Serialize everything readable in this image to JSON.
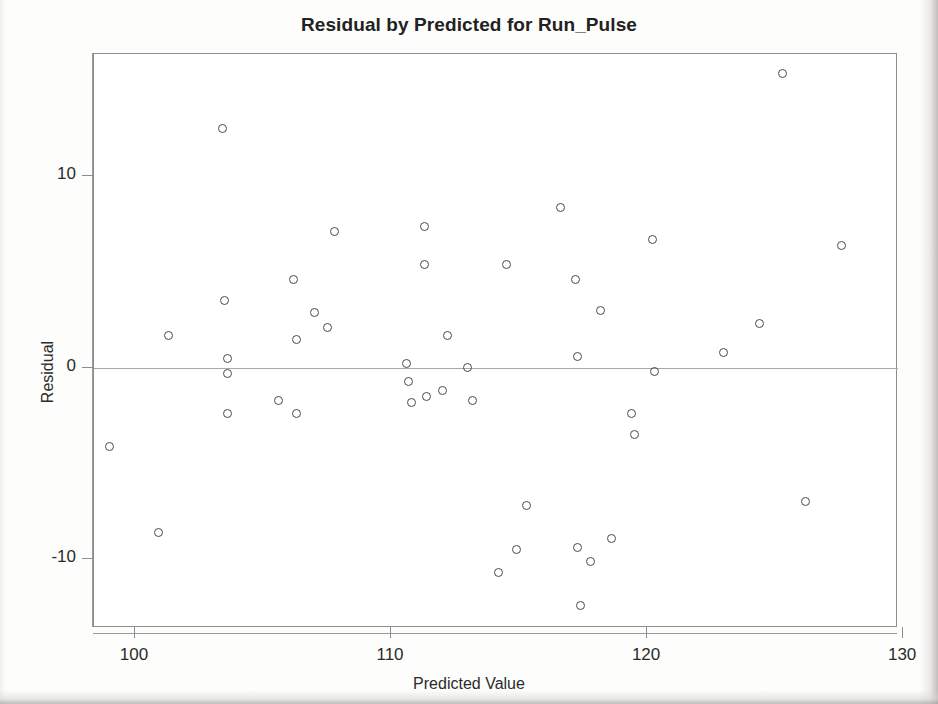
{
  "chart_data": {
    "type": "scatter",
    "title": "Residual by Predicted for Run_Pulse",
    "xlabel": "Predicted Value",
    "ylabel": "Residual",
    "xlim": [
      98.4,
      129.8
    ],
    "ylim": [
      -13.6,
      16.4
    ],
    "xticks": [
      100,
      110,
      120,
      130
    ],
    "yticks": [
      10,
      0,
      -10
    ],
    "grid": false,
    "legend": null,
    "reference_line": {
      "axis": "y",
      "value": 0
    },
    "marker_style": "open-circle",
    "marker_color": "#4a4a4a",
    "points": [
      {
        "x": 99.0,
        "y": -4.1
      },
      {
        "x": 100.9,
        "y": -8.6
      },
      {
        "x": 101.3,
        "y": 1.7
      },
      {
        "x": 103.4,
        "y": 12.5
      },
      {
        "x": 103.5,
        "y": 3.5
      },
      {
        "x": 103.6,
        "y": 0.5
      },
      {
        "x": 103.6,
        "y": -0.3
      },
      {
        "x": 103.6,
        "y": -2.4
      },
      {
        "x": 105.6,
        "y": -1.7
      },
      {
        "x": 106.2,
        "y": 4.6
      },
      {
        "x": 106.3,
        "y": 1.5
      },
      {
        "x": 106.3,
        "y": -2.4
      },
      {
        "x": 107.0,
        "y": 2.9
      },
      {
        "x": 107.5,
        "y": 2.1
      },
      {
        "x": 107.8,
        "y": 7.1
      },
      {
        "x": 110.6,
        "y": 0.2
      },
      {
        "x": 110.7,
        "y": -0.7
      },
      {
        "x": 110.8,
        "y": -1.8
      },
      {
        "x": 111.3,
        "y": 7.4
      },
      {
        "x": 111.3,
        "y": 5.4
      },
      {
        "x": 111.4,
        "y": -1.5
      },
      {
        "x": 112.0,
        "y": -1.2
      },
      {
        "x": 112.2,
        "y": 1.7
      },
      {
        "x": 113.0,
        "y": 0.0
      },
      {
        "x": 113.2,
        "y": -1.7
      },
      {
        "x": 114.2,
        "y": -10.7
      },
      {
        "x": 114.5,
        "y": 5.4
      },
      {
        "x": 114.9,
        "y": -9.5
      },
      {
        "x": 115.3,
        "y": -7.2
      },
      {
        "x": 116.6,
        "y": 8.4
      },
      {
        "x": 117.2,
        "y": 4.6
      },
      {
        "x": 117.3,
        "y": 0.6
      },
      {
        "x": 117.3,
        "y": -9.4
      },
      {
        "x": 117.4,
        "y": -12.4
      },
      {
        "x": 117.8,
        "y": -10.1
      },
      {
        "x": 118.2,
        "y": 3.0
      },
      {
        "x": 118.6,
        "y": -8.9
      },
      {
        "x": 119.4,
        "y": -2.4
      },
      {
        "x": 119.5,
        "y": -3.5
      },
      {
        "x": 120.2,
        "y": 6.7
      },
      {
        "x": 120.3,
        "y": -0.2
      },
      {
        "x": 123.0,
        "y": 0.8
      },
      {
        "x": 124.4,
        "y": 2.3
      },
      {
        "x": 125.3,
        "y": 15.4
      },
      {
        "x": 126.2,
        "y": -7.0
      },
      {
        "x": 127.6,
        "y": 6.4
      }
    ]
  }
}
